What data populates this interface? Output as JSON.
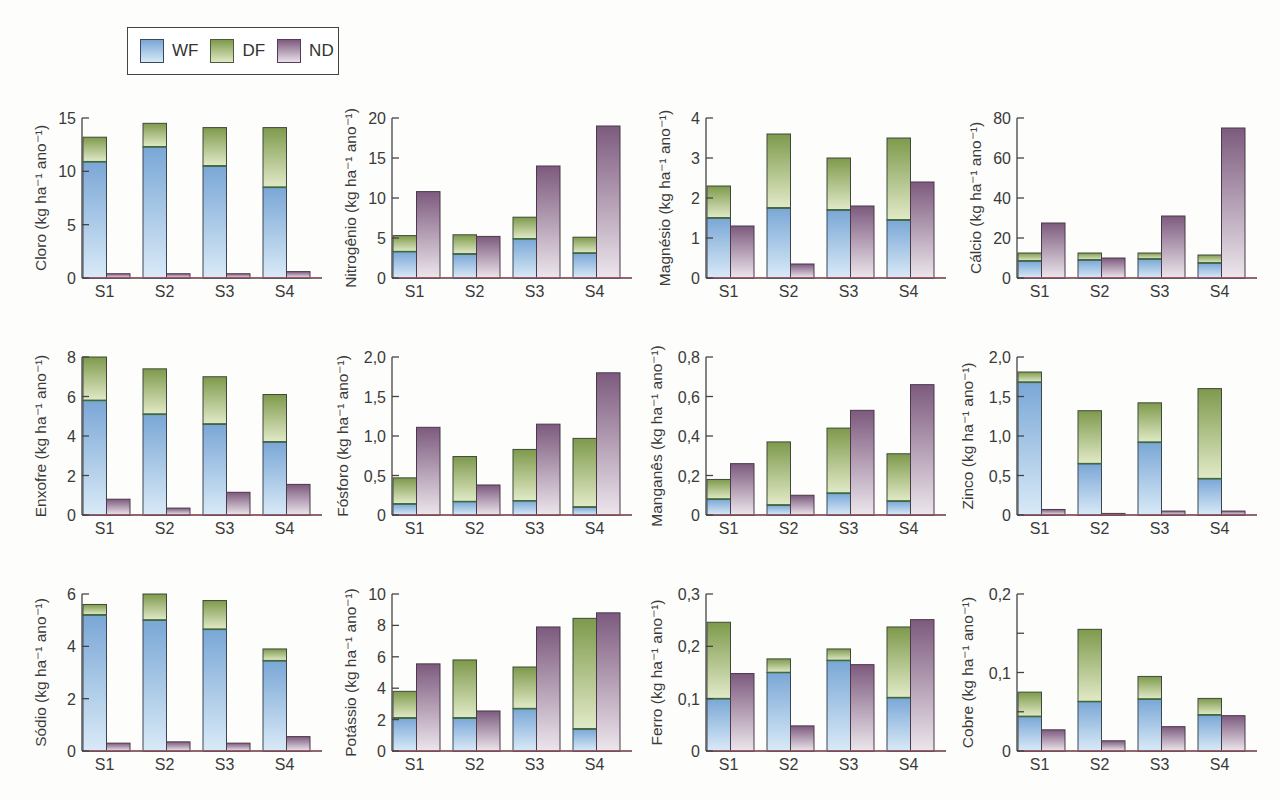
{
  "legend": {
    "items": [
      {
        "key": "WF",
        "label": "WF"
      },
      {
        "key": "DF",
        "label": "DF"
      },
      {
        "key": "ND",
        "label": "ND"
      }
    ]
  },
  "colors": {
    "WF_top": "#7aa7d6",
    "WF_bottom": "#d6e8f6",
    "DF_top": "#7e9a4c",
    "DF_bottom": "#dfe8c4",
    "ND_top": "#7d5a7e",
    "ND_bottom": "#e8e0e8",
    "axis": "#444444",
    "baseline": "#c0506a"
  },
  "chart_data": [
    {
      "type": "bar",
      "title": "Cloro",
      "ylabel": "Cloro (kg ha⁻¹ ano⁻¹)",
      "categories": [
        "S1",
        "S2",
        "S3",
        "S4"
      ],
      "ylim": [
        0,
        15
      ],
      "yticks": [
        0,
        5,
        10,
        15
      ],
      "ytick_labels": [
        "0",
        "5",
        "10",
        "15"
      ],
      "series": [
        {
          "name": "WF",
          "values": [
            10.9,
            12.3,
            10.5,
            8.5
          ]
        },
        {
          "name": "DF",
          "values": [
            2.3,
            2.2,
            3.6,
            5.6
          ]
        },
        {
          "name": "ND",
          "values": [
            0.4,
            0.4,
            0.4,
            0.6
          ]
        }
      ]
    },
    {
      "type": "bar",
      "title": "Nitrogênio",
      "ylabel": "Nitrogênio (kg ha⁻¹ ano⁻¹)",
      "categories": [
        "S1",
        "S2",
        "S3",
        "S4"
      ],
      "ylim": [
        0,
        20
      ],
      "yticks": [
        0,
        5,
        10,
        15,
        20
      ],
      "ytick_labels": [
        "0",
        "5",
        "10",
        "15",
        "20"
      ],
      "series": [
        {
          "name": "WF",
          "values": [
            3.3,
            3.0,
            4.9,
            3.1
          ]
        },
        {
          "name": "DF",
          "values": [
            2.0,
            2.4,
            2.7,
            2.0
          ]
        },
        {
          "name": "ND",
          "values": [
            10.8,
            5.2,
            14.0,
            19.0
          ]
        }
      ]
    },
    {
      "type": "bar",
      "title": "Magnésio",
      "ylabel": "Magnésio (kg ha⁻¹ ano⁻¹)",
      "categories": [
        "S1",
        "S2",
        "S3",
        "S4"
      ],
      "ylim": [
        0,
        4
      ],
      "yticks": [
        0,
        1,
        2,
        3,
        4
      ],
      "ytick_labels": [
        "0",
        "1",
        "2",
        "3",
        "4"
      ],
      "series": [
        {
          "name": "WF",
          "values": [
            1.5,
            1.75,
            1.7,
            1.45
          ]
        },
        {
          "name": "DF",
          "values": [
            0.8,
            1.85,
            1.3,
            2.05
          ]
        },
        {
          "name": "ND",
          "values": [
            1.3,
            0.35,
            1.8,
            2.4
          ]
        }
      ]
    },
    {
      "type": "bar",
      "title": "Cálcio",
      "ylabel": "Cálcio (kg ha⁻¹ ano⁻¹)",
      "categories": [
        "S1",
        "S2",
        "S3",
        "S4"
      ],
      "ylim": [
        0,
        80
      ],
      "yticks": [
        0,
        20,
        40,
        60,
        80
      ],
      "ytick_labels": [
        "0",
        "20",
        "40",
        "60",
        "80"
      ],
      "series": [
        {
          "name": "WF",
          "values": [
            8.5,
            9.0,
            9.5,
            7.5
          ]
        },
        {
          "name": "DF",
          "values": [
            4.0,
            3.5,
            3.0,
            4.0
          ]
        },
        {
          "name": "ND",
          "values": [
            27.5,
            10.0,
            31.0,
            75.0
          ]
        }
      ]
    },
    {
      "type": "bar",
      "title": "Enxofre",
      "ylabel": "Enxofre (kg ha⁻¹ ano⁻¹)",
      "categories": [
        "S1",
        "S2",
        "S3",
        "S4"
      ],
      "ylim": [
        0,
        8
      ],
      "yticks": [
        0,
        2,
        4,
        6,
        8
      ],
      "ytick_labels": [
        "0",
        "2",
        "4",
        "6",
        "8"
      ],
      "series": [
        {
          "name": "WF",
          "values": [
            5.8,
            5.1,
            4.6,
            3.7
          ]
        },
        {
          "name": "DF",
          "values": [
            2.2,
            2.3,
            2.4,
            2.4
          ]
        },
        {
          "name": "ND",
          "values": [
            0.8,
            0.35,
            1.15,
            1.55
          ]
        }
      ]
    },
    {
      "type": "bar",
      "title": "Fósforo",
      "ylabel": "Fósforo (kg ha⁻¹ ano⁻¹)",
      "categories": [
        "S1",
        "S2",
        "S3",
        "S4"
      ],
      "ylim": [
        0,
        2.0
      ],
      "yticks": [
        0,
        0.5,
        1.0,
        1.5,
        2.0
      ],
      "ytick_labels": [
        "0",
        "0,5",
        "1,0",
        "1,5",
        "2,0"
      ],
      "series": [
        {
          "name": "WF",
          "values": [
            0.14,
            0.17,
            0.18,
            0.1
          ]
        },
        {
          "name": "DF",
          "values": [
            0.33,
            0.57,
            0.65,
            0.87
          ]
        },
        {
          "name": "ND",
          "values": [
            1.11,
            0.38,
            1.15,
            1.8
          ]
        }
      ]
    },
    {
      "type": "bar",
      "title": "Manganês",
      "ylabel": "Manganês (kg ha⁻¹ ano⁻¹)",
      "categories": [
        "S1",
        "S2",
        "S3",
        "S4"
      ],
      "ylim": [
        0,
        0.8
      ],
      "yticks": [
        0,
        0.2,
        0.4,
        0.6,
        0.8
      ],
      "ytick_labels": [
        "0",
        "0,2",
        "0,4",
        "0,6",
        "0,8"
      ],
      "series": [
        {
          "name": "WF",
          "values": [
            0.08,
            0.05,
            0.11,
            0.07
          ]
        },
        {
          "name": "DF",
          "values": [
            0.1,
            0.32,
            0.33,
            0.24
          ]
        },
        {
          "name": "ND",
          "values": [
            0.26,
            0.1,
            0.53,
            0.66
          ]
        }
      ]
    },
    {
      "type": "bar",
      "title": "Zinco",
      "ylabel": "Zinco (kg ha⁻¹ ano⁻¹)",
      "categories": [
        "S1",
        "S2",
        "S3",
        "S4"
      ],
      "ylim": [
        0,
        2.0
      ],
      "yticks": [
        0,
        0.5,
        1.0,
        1.5,
        2.0
      ],
      "ytick_labels": [
        "0",
        "0,5",
        "1,0",
        "1,5",
        "2,0"
      ],
      "series": [
        {
          "name": "WF",
          "values": [
            1.68,
            0.65,
            0.92,
            0.46
          ]
        },
        {
          "name": "DF",
          "values": [
            0.13,
            0.67,
            0.5,
            1.14
          ]
        },
        {
          "name": "ND",
          "values": [
            0.07,
            0.02,
            0.05,
            0.05
          ]
        }
      ]
    },
    {
      "type": "bar",
      "title": "Sódio",
      "ylabel": "Sódio (kg ha⁻¹ ano⁻¹)",
      "categories": [
        "S1",
        "S2",
        "S3",
        "S4"
      ],
      "ylim": [
        0,
        6
      ],
      "yticks": [
        0,
        2,
        4,
        6
      ],
      "ytick_labels": [
        "0",
        "2",
        "4",
        "6"
      ],
      "series": [
        {
          "name": "WF",
          "values": [
            5.2,
            5.0,
            4.65,
            3.45
          ]
        },
        {
          "name": "DF",
          "values": [
            0.4,
            1.0,
            1.1,
            0.45
          ]
        },
        {
          "name": "ND",
          "values": [
            0.3,
            0.35,
            0.3,
            0.55
          ]
        }
      ]
    },
    {
      "type": "bar",
      "title": "Potássio",
      "ylabel": "Potássio (kg ha⁻¹ ano⁻¹)",
      "categories": [
        "S1",
        "S2",
        "S3",
        "S4"
      ],
      "ylim": [
        0,
        10
      ],
      "yticks": [
        0,
        2,
        4,
        6,
        8,
        10
      ],
      "ytick_labels": [
        "0",
        "2",
        "4",
        "6",
        "8",
        "10"
      ],
      "series": [
        {
          "name": "WF",
          "values": [
            2.1,
            2.1,
            2.7,
            1.4
          ]
        },
        {
          "name": "DF",
          "values": [
            1.7,
            3.7,
            2.65,
            7.05
          ]
        },
        {
          "name": "ND",
          "values": [
            5.55,
            2.55,
            7.9,
            8.8
          ]
        }
      ]
    },
    {
      "type": "bar",
      "title": "Ferro",
      "ylabel": "Ferro (kg ha⁻¹ ano⁻¹)",
      "categories": [
        "S1",
        "S2",
        "S3",
        "S4"
      ],
      "ylim": [
        0,
        0.3
      ],
      "yticks": [
        0,
        0.1,
        0.2,
        0.3
      ],
      "ytick_labels": [
        "0",
        "0,1",
        "0,2",
        "0,3"
      ],
      "series": [
        {
          "name": "WF",
          "values": [
            0.1,
            0.15,
            0.173,
            0.102
          ]
        },
        {
          "name": "DF",
          "values": [
            0.146,
            0.026,
            0.022,
            0.135
          ]
        },
        {
          "name": "ND",
          "values": [
            0.148,
            0.048,
            0.165,
            0.251
          ]
        }
      ]
    },
    {
      "type": "bar",
      "title": "Cobre",
      "ylabel": "Cobre (kg ha⁻¹ ano⁻¹)",
      "categories": [
        "S1",
        "S2",
        "S3",
        "S4"
      ],
      "ylim": [
        0,
        0.2
      ],
      "yticks": [
        0,
        0.05,
        0.1,
        0.15,
        0.2
      ],
      "ytick_labels": [
        "0",
        "",
        "0,1",
        "",
        "0,2"
      ],
      "series": [
        {
          "name": "WF",
          "values": [
            0.044,
            0.063,
            0.066,
            0.046
          ]
        },
        {
          "name": "DF",
          "values": [
            0.031,
            0.092,
            0.029,
            0.021
          ]
        },
        {
          "name": "ND",
          "values": [
            0.027,
            0.013,
            0.031,
            0.045
          ]
        }
      ]
    }
  ],
  "layout": {
    "cols_axis_x": [
      82,
      392,
      706,
      1017
    ],
    "plot_width": 240,
    "rows": [
      {
        "top": 118,
        "bottom": 278
      },
      {
        "top": 357,
        "bottom": 515
      },
      {
        "top": 594,
        "bottom": 751
      }
    ]
  }
}
